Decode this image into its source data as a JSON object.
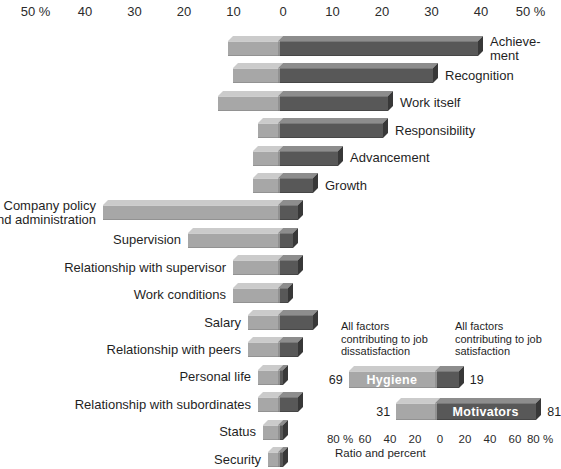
{
  "colors": {
    "background": "#ffffff",
    "text": "#1f1f1f",
    "hygiene_front": "#a7a7a7",
    "hygiene_top": "#cbcbcb",
    "motivator_front": "#585858",
    "motivator_top": "#8d8d8d",
    "motivator_side": "#383838",
    "inset_label_text": "#ffffff"
  },
  "chart_data": [
    {
      "type": "bar",
      "orientation": "horizontal-diverging",
      "title": "",
      "unit": "%",
      "xlim": [
        -50,
        50
      ],
      "grid": false,
      "axis_ticks": [
        "50 %",
        "40",
        "30",
        "20",
        "10",
        "0",
        "10",
        "20",
        "30",
        "40",
        "50 %"
      ],
      "categories": [
        "Achievement",
        "Recognition",
        "Work itself",
        "Responsibility",
        "Advancement",
        "Growth",
        "Company policy and administration",
        "Supervision",
        "Relationship with supervisor",
        "Work conditions",
        "Salary",
        "Relationship with peers",
        "Personal life",
        "Relationship with subordinates",
        "Status",
        "Security"
      ],
      "series": [
        {
          "name": "contributing to job dissatisfaction (extends left of 0)",
          "values": [
            10,
            9,
            12,
            4,
            5,
            5,
            35,
            18,
            9,
            9,
            6,
            6,
            4,
            4,
            3,
            2
          ]
        },
        {
          "name": "contributing to job satisfaction (extends right of 0)",
          "values": [
            40,
            31,
            22,
            21,
            12,
            7,
            4,
            3,
            4,
            2,
            7,
            4,
            1,
            4,
            1,
            1
          ]
        }
      ],
      "label_lines": {
        "0": [
          "Achieve-",
          "ment"
        ],
        "6": [
          "Company policy",
          "and administration"
        ]
      }
    },
    {
      "type": "bar",
      "orientation": "horizontal-diverging",
      "headers": {
        "left": "All factors contributing to job dissatisfaction",
        "right": "All factors contributing to job satisfaction"
      },
      "categories": [
        "Hygiene",
        "Motivators"
      ],
      "series": [
        {
          "name": "dissatisfaction side (left of 0)",
          "values": [
            69,
            31
          ]
        },
        {
          "name": "satisfaction side (right of 0)",
          "values": [
            19,
            81
          ]
        }
      ],
      "value_labels": [
        {
          "left": "69",
          "right": "19"
        },
        {
          "left": "31",
          "right": "81"
        }
      ],
      "xlim": [
        -80,
        80
      ],
      "axis_ticks": [
        "80 %",
        "60",
        "40",
        "20",
        "0",
        "20",
        "40",
        "60",
        "80 %"
      ],
      "caption": "Ratio and percent"
    }
  ]
}
